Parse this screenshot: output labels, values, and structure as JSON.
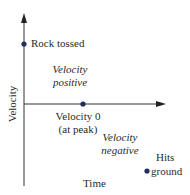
{
  "diagram": {
    "type": "velocity-time graph",
    "axes": {
      "y_label": "Velocity",
      "x_label": "Time"
    },
    "points": [
      {
        "name": "rock-tossed",
        "label": "Rock tossed",
        "x": 24,
        "y": 44
      },
      {
        "name": "peak",
        "label_line1": "Velocity 0",
        "label_line2": "(at peak)",
        "x": 83,
        "y": 104
      },
      {
        "name": "hits-ground",
        "label_line1": "Hits",
        "label_line2": "ground",
        "x": 147,
        "y": 171
      }
    ],
    "regions": {
      "positive": {
        "line1": "Velocity",
        "line2": "positive"
      },
      "negative": {
        "line1": "Velocity",
        "line2": "negative"
      }
    },
    "colors": {
      "axis": "#333333",
      "point": "#1f2e5a",
      "text": "#2a2a2a"
    }
  }
}
